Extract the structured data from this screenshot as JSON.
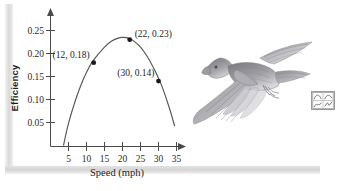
{
  "figure": {
    "kind": "textbook-figure",
    "background_color": "#ffffff",
    "curve_color": "#55555a",
    "axis_color": "#4a4a4a",
    "point_color": "#1a1a1a"
  },
  "chart_data": {
    "type": "line",
    "title": "",
    "subtitle": "",
    "xlabel": "Speed (mph)",
    "ylabel": "Efficiency",
    "xlim": [
      0,
      37
    ],
    "ylim": [
      0,
      0.27
    ],
    "grid": false,
    "legend": "none",
    "x_ticks": [
      5,
      10,
      15,
      20,
      25,
      30,
      35
    ],
    "x_tick_labels": [
      "5",
      "10",
      "15",
      "20",
      "25",
      "30",
      "35"
    ],
    "y_ticks": [
      0.05,
      0.1,
      0.15,
      0.2,
      0.25
    ],
    "y_tick_labels": [
      "0.05",
      "0.10",
      "0.15",
      "0.20",
      "0.25"
    ],
    "series": [
      {
        "name": "efficiency-curve",
        "shape": "downward-parabola",
        "x": [
          3.6,
          5,
          7,
          9,
          11,
          12,
          13,
          15,
          17,
          19,
          20,
          21,
          22,
          23,
          25,
          27,
          29,
          30,
          31,
          33,
          34.5
        ],
        "values": [
          0.0,
          0.048,
          0.1,
          0.142,
          0.174,
          0.186,
          0.196,
          0.214,
          0.227,
          0.234,
          0.235,
          0.2345,
          0.232,
          0.228,
          0.214,
          0.192,
          0.163,
          0.146,
          0.128,
          0.082,
          0.042
        ]
      }
    ],
    "annotated_points": [
      {
        "label": "(12, 0.18)",
        "x": 12,
        "y": 0.18,
        "label_side": "left"
      },
      {
        "label": "(22, 0.23)",
        "x": 22,
        "y": 0.23,
        "label_side": "right"
      },
      {
        "label": "(30, 0.14)",
        "x": 30,
        "y": 0.14,
        "label_side": "left"
      }
    ],
    "axis_arrows": {
      "x": true,
      "y": true
    }
  },
  "illustration": {
    "name": "bird-in-flight-engraving",
    "description": "grayscale engraving of a bird in flight with outstretched wings"
  },
  "margin_icon": {
    "name": "graph-thumbnail-icon",
    "description": "small boxed thumbnail of four mini graphs"
  }
}
